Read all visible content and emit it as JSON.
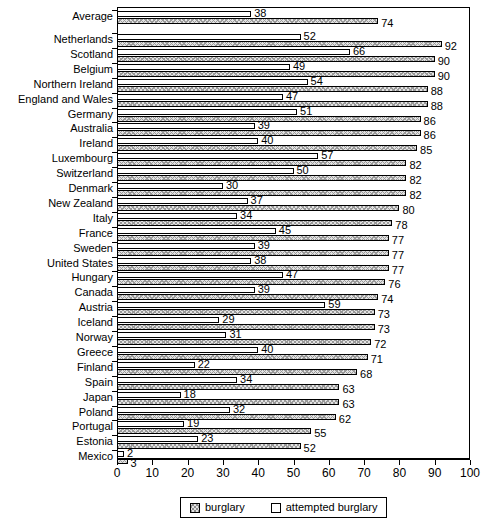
{
  "chart_data": {
    "type": "bar",
    "orientation": "horizontal",
    "title": "",
    "xlabel": "",
    "ylabel": "",
    "xlim": [
      0,
      100
    ],
    "xticks": [
      0,
      10,
      20,
      30,
      40,
      50,
      60,
      70,
      80,
      90,
      100
    ],
    "grid": false,
    "legend_position": "bottom",
    "categories": [
      "Average",
      "Netherlands",
      "Scotland",
      "Belgium",
      "Northern Ireland",
      "England and Wales",
      "Germany",
      "Australia",
      "Ireland",
      "Luxembourg",
      "Switzerland",
      "Denmark",
      "New Zealand",
      "Italy",
      "France",
      "Sweden",
      "United States",
      "Hungary",
      "Canada",
      "Austria",
      "Iceland",
      "Norway",
      "Greece",
      "Finland",
      "Spain",
      "Japan",
      "Poland",
      "Portugal",
      "Estonia",
      "Mexico"
    ],
    "series": [
      {
        "name": "attempted burglary",
        "fill": "white",
        "values": [
          38,
          52,
          66,
          49,
          54,
          47,
          51,
          39,
          40,
          57,
          50,
          30,
          37,
          34,
          45,
          39,
          38,
          47,
          39,
          59,
          29,
          31,
          40,
          22,
          34,
          18,
          32,
          19,
          23,
          2
        ]
      },
      {
        "name": "burglary",
        "fill": "hatched",
        "values": [
          74,
          92,
          90,
          90,
          88,
          88,
          86,
          86,
          85,
          82,
          82,
          82,
          80,
          78,
          77,
          77,
          77,
          76,
          74,
          73,
          73,
          72,
          71,
          68,
          63,
          63,
          62,
          55,
          52,
          3
        ]
      }
    ]
  },
  "legend": {
    "items": [
      {
        "label": "burglary",
        "swatch": "hatched"
      },
      {
        "label": "attempted burglary",
        "swatch": "white"
      }
    ]
  },
  "colors": {
    "axis": "#000000",
    "bar_outline": "#000000",
    "hatched_fill": "#e2e2e2",
    "white_fill": "#ffffff",
    "background": "#ffffff"
  }
}
